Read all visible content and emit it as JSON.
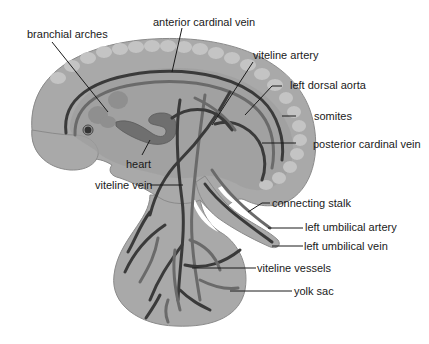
{
  "diagram": {
    "colors": {
      "background": "#ffffff",
      "body_fill": "#a9a9a9",
      "body_outline": "#8a8a8a",
      "somite_fill": "#c4c4c4",
      "inner_fill": "#9c9c9c",
      "heart_fill": "#6f6f6f",
      "vessel_dark": "#3a3a3a",
      "vessel_mid": "#6a6a6a",
      "label_text": "#1a1a1a"
    },
    "labels": {
      "anterior_cardinal_vein": "anterior cardinal vein",
      "branchial_arches": "branchial arches",
      "viteline_artery": "viteline artery",
      "left_dorsal_aorta": "left dorsal aorta",
      "somites": "somites",
      "posterior_cardinal_vein": "posterior cardinal vein",
      "heart": "heart",
      "viteline_vein": "viteline vein",
      "connecting_stalk": "connecting stalk",
      "left_umbilical_artery": "left umbilical artery",
      "left_umbilical_vein": "left umbilical vein",
      "viteline_vessels": "viteline vessels",
      "yolk_sac": "yolk sac"
    }
  }
}
